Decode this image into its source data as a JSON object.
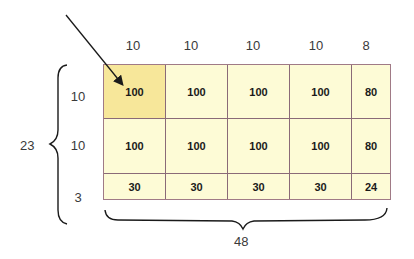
{
  "column_widths": [
    "10",
    "10",
    "10",
    "10",
    "8"
  ],
  "row_heights": [
    "10",
    "10",
    "3"
  ],
  "total_height": "23",
  "total_width": "48",
  "cells": [
    [
      "100",
      "100",
      "100",
      "100",
      "80"
    ],
    [
      "100",
      "100",
      "100",
      "100",
      "80"
    ],
    [
      "30",
      "30",
      "30",
      "30",
      "24"
    ]
  ],
  "highlighted_cell": {
    "row": 0,
    "col": 0
  },
  "colors": {
    "cell_fill": "#fdfbd6",
    "highlight_fill": "#f7e79a",
    "grid_line": "#8a6a78"
  }
}
